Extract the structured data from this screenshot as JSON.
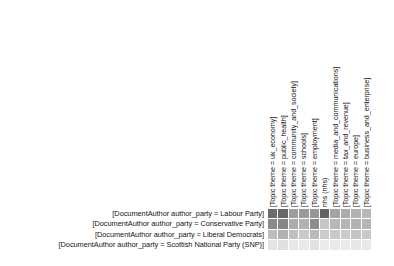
{
  "chart_data": {
    "type": "heatmap",
    "title": "",
    "subtitle": "",
    "xlabel": "",
    "ylabel": "",
    "grid": false,
    "legend_position": "none",
    "colormap": "greys",
    "colormap_low_hex": "#f7f7f7",
    "colormap_high_hex": "#5a5a5a",
    "value_range": [
      0,
      1
    ],
    "axis_label_rotation_deg": 90,
    "columns": [
      "[Topic theme = uk_economy]",
      "[Topic theme = public_health]",
      "[Topic theme = community_and_society]",
      "[Topic theme = schools]",
      "[Topic theme = employment]",
      "nhs (nhs)",
      "[Topic theme = media_and_communications]",
      "[Topic theme = tax_and_revenue]",
      "[Topic theme = europe]",
      "[Topic theme = business_and_enterprise]"
    ],
    "rows": [
      "[DocumentAuthor author_party = Labour Party]",
      "[DocumentAuthor author_party = Conservative Party]",
      "[DocumentAuthor author_party = Liberal Democrats]",
      "[DocumentAuthor author_party = Scottish National Party (SNP)]"
    ],
    "values": [
      [
        0.72,
        0.76,
        0.44,
        0.46,
        0.5,
        0.8,
        0.4,
        0.34,
        0.3,
        0.26
      ],
      [
        0.56,
        0.58,
        0.34,
        0.3,
        0.54,
        0.2,
        0.26,
        0.28,
        0.3,
        0.28
      ],
      [
        0.24,
        0.3,
        0.22,
        0.18,
        0.26,
        0.16,
        0.18,
        0.16,
        0.2,
        0.18
      ],
      [
        0.1,
        0.12,
        0.09,
        0.08,
        0.11,
        0.07,
        0.08,
        0.07,
        0.09,
        0.08
      ]
    ],
    "cell_colors": [
      [
        "#6b6b6b",
        "#676767",
        "#9e9e9e",
        "#9b9b9b",
        "#969696",
        "#636363",
        "#a4a4a4",
        "#acacac",
        "#b2b2b2",
        "#b8b8b8"
      ],
      [
        "#8a8a8a",
        "#878787",
        "#acacac",
        "#b2b2b2",
        "#8d8d8d",
        "#c6c6c6",
        "#b8b8b8",
        "#b5b5b5",
        "#b2b2b2",
        "#b5b5b5"
      ],
      [
        "#bdbdbd",
        "#b2b2b2",
        "#c0c0c0",
        "#c9c9c9",
        "#bababa",
        "#cccccc",
        "#c9c9c9",
        "#cccccc",
        "#c4c4c4",
        "#c9c9c9"
      ],
      [
        "#e4e4e4",
        "#e0e0e0",
        "#e7e7e7",
        "#e9e9e9",
        "#e2e2e2",
        "#ebebeb",
        "#e9e9e9",
        "#ebebeb",
        "#e7e7e7",
        "#e9e9e9"
      ]
    ]
  }
}
